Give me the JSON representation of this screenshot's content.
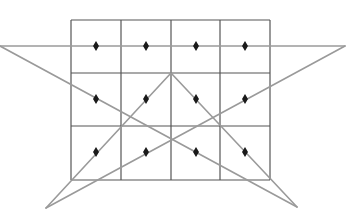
{
  "diagram": {
    "background": "#ffffff",
    "grid": {
      "columns_x": [
        71,
        121,
        171,
        220,
        270
      ],
      "rows_y": [
        20,
        73,
        126,
        180
      ],
      "stroke": "#555555",
      "stroke_width": 1.2
    },
    "star": {
      "stroke": "#9a9a9a",
      "stroke_width": 1.6,
      "points": {
        "left_tip": [
          0,
          46
        ],
        "right_tip": [
          345,
          46
        ],
        "apex": [
          171,
          73
        ],
        "bottom_left": [
          46,
          208
        ],
        "bottom_right": [
          297,
          207
        ]
      },
      "segments": [
        [
          "left_tip",
          "right_tip"
        ],
        [
          "left_tip",
          "bottom_right"
        ],
        [
          "right_tip",
          "bottom_left"
        ],
        [
          "bottom_left",
          "apex"
        ],
        [
          "apex",
          "bottom_right"
        ]
      ]
    },
    "markers": {
      "shape": "diamond",
      "color": "#1a1a1a",
      "width": 6,
      "height": 10,
      "positions": [
        [
          96,
          46
        ],
        [
          146,
          46
        ],
        [
          196,
          46
        ],
        [
          245,
          46
        ],
        [
          96,
          99
        ],
        [
          146,
          99
        ],
        [
          196,
          99
        ],
        [
          245,
          99
        ],
        [
          96,
          152
        ],
        [
          146,
          152
        ],
        [
          196,
          152
        ],
        [
          245,
          152
        ]
      ]
    }
  }
}
